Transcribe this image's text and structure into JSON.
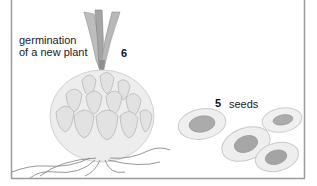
{
  "figure": {
    "labels": {
      "germination_line1": "germination",
      "germination_line2": "of a new plant",
      "num6": "6",
      "num5": "5",
      "seeds": "seeds"
    },
    "colors": {
      "border": "#9a9a9a",
      "bulb_fill": "#e6e6e6",
      "bulb_shade": "#b5b5b5",
      "shoot": "#a8a8a8",
      "roots": "#8c8c8c",
      "seed_outer": "#ececec",
      "seed_inner": "#a9a9a9"
    }
  }
}
